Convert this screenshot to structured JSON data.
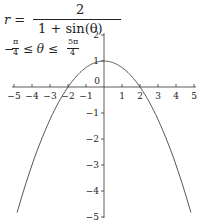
{
  "chart_data": {
    "type": "line",
    "subtitle": "−π/4 ≤ θ ≤ 5π/4",
    "equation": {
      "lhs": "r =",
      "numerator": "2",
      "denominator": "1 + sin(θ)"
    },
    "domain": {
      "lhs": "−",
      "frac1_num": "π",
      "frac1_den": "4",
      "mid": "≤ θ ≤",
      "frac2_num": "5π",
      "frac2_den": "4"
    },
    "xlabel": "",
    "ylabel": "",
    "xlim": [
      -5,
      5
    ],
    "ylim": [
      -5,
      2
    ],
    "x_ticks": [
      "−5",
      "−4",
      "−3",
      "−2",
      "−1",
      "0",
      "1",
      "2",
      "3",
      "4",
      "5"
    ],
    "y_ticks": [
      "2",
      "1",
      "−1",
      "−2",
      "−3",
      "−4",
      "−5"
    ],
    "grid": false,
    "series": [
      {
        "name": "polar curve",
        "x": [
          -4.83,
          -4,
          -3,
          -2,
          -1,
          0,
          1,
          2,
          3,
          4,
          4.83
        ],
        "y": [
          -4.83,
          -3,
          -1.25,
          0,
          0.75,
          1,
          0.75,
          0,
          -1.25,
          -3,
          -4.83
        ]
      }
    ]
  }
}
